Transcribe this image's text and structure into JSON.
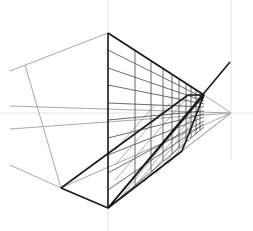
{
  "diagram": {
    "colors": {
      "background": "#ffffff",
      "ink": "#1a1a1a",
      "guide": "#a8a8a8",
      "faint": "#e2e2e2",
      "grid": "#333333"
    },
    "points": {
      "vp_right": [
        231,
        113
      ],
      "apex": [
        230,
        62
      ],
      "top": [
        108,
        33
      ],
      "bottom": [
        108,
        208
      ],
      "left_corner": [
        61,
        188
      ],
      "right_top": [
        204,
        95
      ],
      "right_low": [
        182,
        151
      ],
      "left_guide_top": [
        25,
        65
      ]
    }
  }
}
